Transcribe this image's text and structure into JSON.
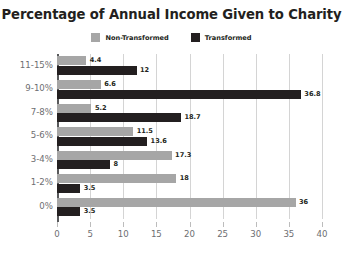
{
  "chart_data": {
    "type": "bar",
    "orientation": "horizontal",
    "title": "Percentage of Annual Income Given to Charity",
    "xlabel": "",
    "ylabel": "",
    "xlim": [
      0,
      40
    ],
    "xticks": [
      0,
      5,
      10,
      15,
      20,
      25,
      30,
      35,
      40
    ],
    "grid": true,
    "legend_position": "top-center",
    "categories": [
      "11-15%",
      "9-10%",
      "7-8%",
      "5-6%",
      "3-4%",
      "1-2%",
      "0%"
    ],
    "series": [
      {
        "name": "Non-Transformed",
        "color": "#a6a6a6",
        "values": [
          4.4,
          6.6,
          5.2,
          11.5,
          17.3,
          18,
          36
        ],
        "labels": [
          "4.4",
          "6.6",
          "5.2",
          "11.5",
          "17.3",
          "18",
          "36"
        ]
      },
      {
        "name": "Transformed",
        "color": "#231f20",
        "values": [
          12,
          36.8,
          18.7,
          13.6,
          8,
          3.5,
          3.5
        ],
        "labels": [
          "12",
          "36.8",
          "18.7",
          "13.6",
          "8",
          "3.5",
          "3.5"
        ]
      }
    ]
  },
  "axis": {
    "tick_labels": [
      "0",
      "5",
      "10",
      "15",
      "20",
      "25",
      "30",
      "35",
      "40"
    ],
    "category_labels": [
      "11-15%",
      "9-10%",
      "7-8%",
      "5-6%",
      "3-4%",
      "1-2%",
      "0%"
    ]
  },
  "legend": {
    "entries": [
      {
        "label": "Non-Transformed",
        "color": "#a6a6a6"
      },
      {
        "label": "Transformed",
        "color": "#231f20"
      }
    ]
  },
  "colors": {
    "non_transformed": "#a6a6a6",
    "transformed": "#231f20",
    "gridline": "#d4d4d4",
    "axis": "#58595b",
    "tick_text": "#6d6e71",
    "title_text": "#231f20",
    "background": "#ffffff"
  }
}
